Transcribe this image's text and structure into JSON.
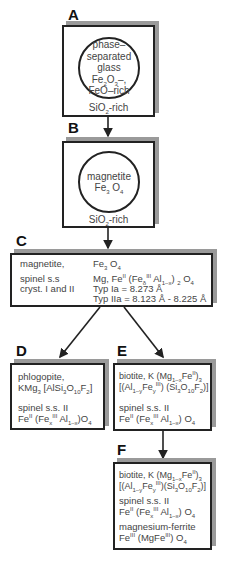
{
  "labels": {
    "a": "A",
    "b": "B",
    "c": "C",
    "d": "D",
    "e": "E",
    "f": "F"
  },
  "box_a": {
    "circle_lines": [
      "phase–",
      "separated",
      "glass"
    ],
    "circle_formula_1": {
      "fe": "Fe",
      "s1": "2",
      "o": "O",
      "s2": "3",
      "tail": "–,"
    },
    "circle_formula_2": "FeO–rich",
    "bottom": {
      "si": "SiO",
      "sub": "2",
      "tail": "-rich"
    }
  },
  "box_b": {
    "circle_name": "magnetite",
    "formula": {
      "fe": "Fe",
      "s1": "3",
      "o": " O",
      "s2": "4"
    },
    "bottom": {
      "si": "SiO",
      "sub": "2",
      "tail": "-rich"
    }
  },
  "box_c": {
    "left_1": "magnetite,",
    "left_2": "spinel s.s",
    "left_3": "cryst. I and II",
    "right_1": {
      "fe": "Fe",
      "s1": "3",
      "o": " O",
      "s2": "4"
    },
    "right_2": {
      "a": "Mg, Fe",
      "sup1": "II",
      "b": " (Fe",
      "sub1": "δ",
      "sup2": "III",
      "c": " Al",
      "sub2": "1–x",
      "d": ") ",
      "sub3": "2",
      "e": " O",
      "sub4": "4"
    },
    "right_3": "Typ   Ia = 8.273 Å",
    "right_4": "Typ IIa = 8.123 Å - 8.225 Å"
  },
  "box_d": {
    "line_1": "phlogopite,",
    "line_2": {
      "a": "KMg",
      "s1": "3",
      "b": " [AlSi",
      "s2": "3",
      "c": "O",
      "s3": "10",
      "d": "F",
      "s4": "2",
      "e": "]"
    },
    "line_3": "spinel s.s. II",
    "line_4": {
      "a": "Fe",
      "sup1": "II",
      "b": " (Fe",
      "sub1": "x",
      "sup2": "III",
      "c": " Al",
      "sub2": "1–x",
      "d": ")O",
      "sub3": "4"
    }
  },
  "box_e": {
    "line_1": {
      "a": "biotite, K (Mg",
      "s1": "1–x",
      "b": "Fe",
      "sup1": "II",
      "c": ")",
      "s2": "3"
    },
    "line_2": {
      "a": "[(Al",
      "s1": "1–y",
      "b": "Fe",
      "s2": "y",
      "sup1": "III",
      "c": ") (Si",
      "s3": "3",
      "d": "O",
      "s4": "10",
      "e": "F",
      "s5": "2",
      "f": ")]"
    },
    "line_3": "spinel s.s. II",
    "line_4": {
      "a": "Fe",
      "sup1": "II",
      "b": " (Fe",
      "sub1": "x",
      "sup2": "III",
      "c": " Al",
      "sub2": "1–x",
      "d": ") O",
      "sub3": "4"
    }
  },
  "box_f": {
    "line_1": {
      "a": "biotite, K (Mg",
      "s1": "1–x",
      "b": "Fe",
      "sup1": "II",
      "c": ")",
      "s2": "3"
    },
    "line_2": {
      "a": "[(Al",
      "s1": "1–y",
      "b": "Fe",
      "s2": "y",
      "sup1": "III",
      "c": ")(Si",
      "s3": "3",
      "d": "O",
      "s4": "10",
      "e": "F",
      "s5": "2",
      "f": ")]"
    },
    "line_3": "spinel s.s. II",
    "line_4": {
      "a": "Fe",
      "sup1": "II",
      "b": " (Fe",
      "sub1": "x",
      "sup2": "III",
      "c": " Al",
      "sub2": "1–x",
      "d": ") O",
      "sub3": "4"
    },
    "line_5": "magnesium-ferrite",
    "line_6": {
      "a": "Fe",
      "sup1": "III",
      "b": " (MgFe",
      "sup2": "III",
      "c": ") O",
      "sub1": "4"
    }
  },
  "colors": {
    "stroke": "#222222",
    "shadow": "#9a9a9a",
    "text": "#444444"
  }
}
